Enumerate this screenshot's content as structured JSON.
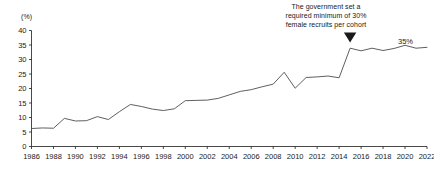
{
  "chart_data": {
    "type": "line",
    "title": "",
    "xlabel": "",
    "ylabel": "",
    "unit_label": "(%)",
    "ylim": [
      0,
      40
    ],
    "yticks": [
      0,
      5,
      10,
      15,
      20,
      25,
      30,
      35,
      40
    ],
    "xlim": [
      1986,
      2022
    ],
    "xticks": [
      1986,
      1988,
      1990,
      1992,
      1994,
      1996,
      1998,
      2000,
      2002,
      2004,
      2006,
      2008,
      2010,
      2012,
      2014,
      2016,
      2018,
      2020,
      2022
    ],
    "grid": false,
    "legend": "none",
    "line_color": "#4d4d4d",
    "x": [
      1986,
      1987,
      1988,
      1989,
      1990,
      1991,
      1992,
      1993,
      1994,
      1995,
      1996,
      1997,
      1998,
      1999,
      2000,
      2001,
      2002,
      2003,
      2004,
      2005,
      2006,
      2007,
      2008,
      2009,
      2010,
      2011,
      2012,
      2013,
      2014,
      2015,
      2016,
      2017,
      2018,
      2019,
      2020,
      2021,
      2022
    ],
    "values": [
      6.2,
      6.4,
      6.3,
      9.7,
      8.8,
      8.9,
      10.3,
      9.3,
      12.0,
      14.5,
      13.8,
      12.9,
      12.4,
      13.0,
      15.8,
      15.9,
      16.0,
      16.6,
      17.8,
      19.0,
      19.6,
      20.6,
      21.5,
      25.6,
      20.1,
      23.8,
      24.0,
      24.3,
      23.7,
      33.9,
      33.0,
      33.9,
      33.1,
      33.8,
      34.9,
      33.9,
      34.2
    ],
    "series": [
      {
        "name": "Female recruits share",
        "values": [
          6.2,
          6.4,
          6.3,
          9.7,
          8.8,
          8.9,
          10.3,
          9.3,
          12.0,
          14.5,
          13.8,
          12.9,
          12.4,
          13.0,
          15.8,
          15.9,
          16.0,
          16.6,
          17.8,
          19.0,
          19.6,
          20.6,
          21.5,
          25.6,
          20.1,
          23.8,
          24.0,
          24.3,
          23.7,
          33.9,
          33.0,
          33.9,
          33.1,
          33.8,
          34.9,
          33.9,
          34.2
        ]
      }
    ],
    "annotations": [
      {
        "name": "policy-annotation",
        "lines": [
          "The government set a",
          "required minimum of 30%",
          "female recruits per cohort"
        ],
        "marker": "down-triangle",
        "points_at_x": 2015
      },
      {
        "name": "end-value-label",
        "text": "35%",
        "at_x": 2022,
        "at_y": 34.2
      }
    ]
  }
}
